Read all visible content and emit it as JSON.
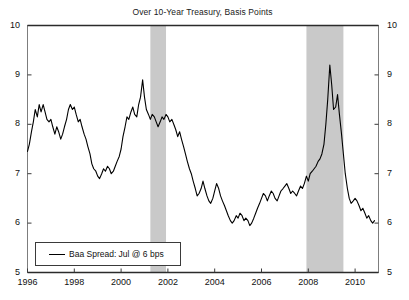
{
  "chart_data": {
    "type": "line",
    "title": "Over 10-Year Treasury, Basis Points",
    "xlabel": "",
    "ylabel": "",
    "xlim": [
      1996.0,
      2011.0
    ],
    "ylim": [
      5,
      10
    ],
    "grid": false,
    "legend_position": "bottom-left",
    "y_ticks": [
      5,
      6,
      7,
      8,
      9,
      10
    ],
    "y_tick_labels": [
      "5",
      "6",
      "7",
      "8",
      "9",
      "10"
    ],
    "right_axis_ticks": [
      5,
      6,
      7,
      8,
      9,
      10
    ],
    "right_axis_tick_labels": [
      "5",
      "6",
      "7",
      "8",
      "9",
      "10"
    ],
    "x_ticks": [
      1996,
      1998,
      2000,
      2002,
      2004,
      2006,
      2008,
      2010
    ],
    "x_tick_labels": [
      "1996",
      "1998",
      "2000",
      "2002",
      "2004",
      "2006",
      "2008",
      "2010"
    ],
    "series": [
      {
        "name": "Baa Spread: Jul @ 6 bps",
        "color": "#000000",
        "x": [
          1996.0,
          1996.08,
          1996.17,
          1996.25,
          1996.33,
          1996.42,
          1996.5,
          1996.58,
          1996.67,
          1996.75,
          1996.83,
          1996.92,
          1997.0,
          1997.08,
          1997.17,
          1997.25,
          1997.33,
          1997.42,
          1997.5,
          1997.58,
          1997.67,
          1997.75,
          1997.83,
          1997.92,
          1998.0,
          1998.08,
          1998.17,
          1998.25,
          1998.33,
          1998.42,
          1998.5,
          1998.58,
          1998.67,
          1998.75,
          1998.83,
          1998.92,
          1999.0,
          1999.08,
          1999.17,
          1999.25,
          1999.33,
          1999.42,
          1999.5,
          1999.58,
          1999.67,
          1999.75,
          1999.83,
          1999.92,
          2000.0,
          2000.08,
          2000.17,
          2000.25,
          2000.33,
          2000.42,
          2000.5,
          2000.58,
          2000.67,
          2000.75,
          2000.83,
          2000.92,
          2001.0,
          2001.08,
          2001.17,
          2001.25,
          2001.33,
          2001.42,
          2001.5,
          2001.58,
          2001.67,
          2001.75,
          2001.83,
          2001.92,
          2002.0,
          2002.08,
          2002.17,
          2002.25,
          2002.33,
          2002.42,
          2002.5,
          2002.58,
          2002.67,
          2002.75,
          2002.83,
          2002.92,
          2003.0,
          2003.08,
          2003.17,
          2003.25,
          2003.33,
          2003.42,
          2003.5,
          2003.58,
          2003.67,
          2003.75,
          2003.83,
          2003.92,
          2004.0,
          2004.08,
          2004.17,
          2004.25,
          2004.33,
          2004.42,
          2004.5,
          2004.58,
          2004.67,
          2004.75,
          2004.83,
          2004.92,
          2005.0,
          2005.08,
          2005.17,
          2005.25,
          2005.33,
          2005.42,
          2005.5,
          2005.58,
          2005.67,
          2005.75,
          2005.83,
          2005.92,
          2006.0,
          2006.08,
          2006.17,
          2006.25,
          2006.33,
          2006.42,
          2006.5,
          2006.58,
          2006.67,
          2006.75,
          2006.83,
          2006.92,
          2007.0,
          2007.08,
          2007.17,
          2007.25,
          2007.33,
          2007.42,
          2007.5,
          2007.58,
          2007.67,
          2007.75,
          2007.83,
          2007.92,
          2008.0,
          2008.08,
          2008.17,
          2008.25,
          2008.33,
          2008.42,
          2008.5,
          2008.58,
          2008.67,
          2008.75,
          2008.83,
          2008.92,
          2009.0,
          2009.08,
          2009.17,
          2009.25,
          2009.33,
          2009.42,
          2009.5,
          2009.58,
          2009.67,
          2009.75,
          2009.83,
          2009.92,
          2010.0,
          2010.08,
          2010.17,
          2010.25,
          2010.33,
          2010.42,
          2010.5,
          2010.58,
          2010.67,
          2010.75,
          2010.83
        ],
        "y": [
          7.45,
          7.6,
          7.85,
          8.05,
          8.3,
          8.15,
          8.4,
          8.25,
          8.4,
          8.25,
          8.1,
          8.05,
          8.1,
          7.95,
          7.8,
          7.95,
          7.85,
          7.7,
          7.8,
          7.95,
          8.1,
          8.3,
          8.4,
          8.3,
          8.35,
          8.2,
          8.05,
          8.1,
          7.95,
          7.8,
          7.7,
          7.55,
          7.4,
          7.2,
          7.1,
          7.05,
          6.95,
          6.9,
          7.0,
          7.1,
          7.05,
          7.15,
          7.1,
          7.0,
          7.05,
          7.15,
          7.25,
          7.35,
          7.5,
          7.75,
          7.95,
          8.15,
          8.1,
          8.25,
          8.35,
          8.2,
          8.15,
          8.4,
          8.55,
          8.9,
          8.55,
          8.3,
          8.2,
          8.1,
          8.2,
          8.15,
          8.05,
          7.95,
          8.05,
          8.15,
          8.1,
          8.2,
          8.15,
          8.05,
          8.1,
          8.0,
          7.9,
          7.75,
          7.85,
          7.7,
          7.55,
          7.4,
          7.25,
          7.1,
          7.0,
          6.85,
          6.7,
          6.55,
          6.6,
          6.7,
          6.85,
          6.7,
          6.55,
          6.45,
          6.4,
          6.5,
          6.65,
          6.8,
          6.7,
          6.55,
          6.45,
          6.35,
          6.25,
          6.15,
          6.05,
          6.0,
          6.05,
          6.15,
          6.1,
          6.2,
          6.15,
          6.05,
          6.1,
          6.05,
          5.95,
          6.0,
          6.1,
          6.2,
          6.3,
          6.4,
          6.5,
          6.6,
          6.55,
          6.45,
          6.55,
          6.65,
          6.6,
          6.5,
          6.45,
          6.55,
          6.65,
          6.7,
          6.75,
          6.8,
          6.7,
          6.6,
          6.65,
          6.6,
          6.55,
          6.65,
          6.75,
          6.7,
          6.8,
          6.95,
          6.85,
          7.0,
          7.05,
          7.1,
          7.15,
          7.25,
          7.3,
          7.4,
          7.6,
          8.0,
          8.5,
          9.2,
          8.8,
          8.3,
          8.35,
          8.6,
          8.2,
          7.8,
          7.4,
          7.0,
          6.7,
          6.5,
          6.4,
          6.45,
          6.5,
          6.45,
          6.35,
          6.25,
          6.3,
          6.2,
          6.1,
          6.15,
          6.05,
          6.0,
          6.05
        ]
      }
    ],
    "shaded_regions": [
      {
        "name": "recession-2001",
        "start": 2001.25,
        "end": 2001.92,
        "color": "#c9c9c9"
      },
      {
        "name": "recession-2008",
        "start": 2007.92,
        "end": 2009.5,
        "color": "#c9c9c9"
      }
    ],
    "legend": [
      {
        "label": "Baa Spread: Jul @ 6 bps",
        "color": "#000000"
      }
    ]
  }
}
